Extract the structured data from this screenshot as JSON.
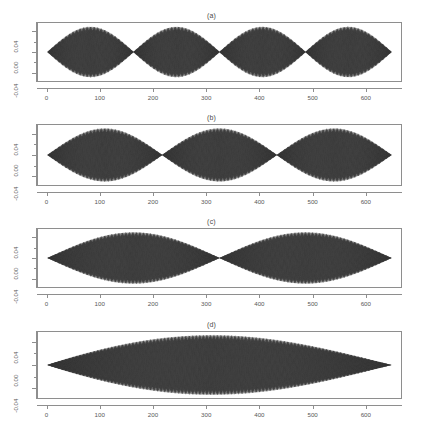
{
  "figure": {
    "caption_fragment": "",
    "background": "#ffffff",
    "trace_color": "#3a3a3a"
  },
  "axes": {
    "x_ticks": [
      0,
      100,
      200,
      300,
      400,
      500,
      600
    ],
    "x_tick_labels": [
      "0",
      "100",
      "200",
      "300",
      "400",
      "500",
      "600"
    ],
    "y_ticks": [
      -0.04,
      0.0,
      0.04
    ],
    "y_tick_labels": [
      "-0.04",
      "0.00",
      "0.04"
    ],
    "xlim": [
      -18,
      668
    ],
    "ylim": [
      -0.058,
      0.058
    ]
  },
  "chart_data": [
    {
      "type": "line",
      "title": "(a)",
      "xlabel": "",
      "ylabel": "",
      "xlim": [
        -18,
        668
      ],
      "ylim": [
        -0.058,
        0.058
      ],
      "xticks": [
        0,
        100,
        200,
        300,
        400,
        500,
        600
      ],
      "yticks": [
        -0.04,
        0.0,
        0.04
      ],
      "grid": false,
      "legend": "none",
      "description": "Dense oscillatory signal filling a 4-lobe sine envelope; nodes (zero amplitude) at x = 0, 163, 325, 488, 650.",
      "envelope": {
        "type": "abs-sine",
        "half_periods": 4,
        "amplitude": 0.051,
        "x_start": 0,
        "x_end": 650,
        "nodes": [
          0,
          163,
          325,
          488,
          650
        ],
        "antinodes": [
          81,
          244,
          406,
          569
        ]
      }
    },
    {
      "type": "line",
      "title": "(b)",
      "xlabel": "",
      "ylabel": "",
      "xlim": [
        -18,
        668
      ],
      "ylim": [
        -0.058,
        0.058
      ],
      "xticks": [
        0,
        100,
        200,
        300,
        400,
        500,
        600
      ],
      "yticks": [
        -0.04,
        0.0,
        0.04
      ],
      "grid": false,
      "legend": "none",
      "description": "Dense oscillatory signal filling a 3-lobe sine envelope; nodes at x = 0, 217, 433, 650.",
      "envelope": {
        "type": "abs-sine",
        "half_periods": 3,
        "amplitude": 0.052,
        "x_start": 0,
        "x_end": 650,
        "nodes": [
          0,
          217,
          433,
          650
        ],
        "antinodes": [
          108,
          325,
          542
        ]
      }
    },
    {
      "type": "line",
      "title": "(c)",
      "xlabel": "",
      "ylabel": "",
      "xlim": [
        -18,
        668
      ],
      "ylim": [
        -0.058,
        0.058
      ],
      "xticks": [
        0,
        100,
        200,
        300,
        400,
        500,
        600
      ],
      "yticks": [
        -0.04,
        0.0,
        0.04
      ],
      "grid": false,
      "legend": "none",
      "description": "Dense oscillatory signal filling a 2-lobe sine envelope; nodes at x = 0, 325, 650.",
      "envelope": {
        "type": "abs-sine",
        "half_periods": 2,
        "amplitude": 0.052,
        "x_start": 0,
        "x_end": 650,
        "nodes": [
          0,
          325,
          650
        ],
        "antinodes": [
          163,
          488
        ]
      }
    },
    {
      "type": "line",
      "title": "(d)",
      "xlabel": "",
      "ylabel": "",
      "xlim": [
        -18,
        668
      ],
      "ylim": [
        -0.058,
        0.058
      ],
      "xticks": [
        0,
        100,
        200,
        300,
        400,
        500,
        600
      ],
      "yticks": [
        -0.04,
        0.0,
        0.04
      ],
      "grid": false,
      "legend": "none",
      "description": "Dense oscillatory signal filling a single-lobe sine envelope, slightly skewed with peak near x = 310; nodes at x = 0 and 650.",
      "envelope": {
        "type": "abs-sine-skewed",
        "half_periods": 1,
        "amplitude": 0.053,
        "x_start": 0,
        "x_end": 650,
        "nodes": [
          0,
          650
        ],
        "antinodes": [
          310
        ]
      }
    }
  ],
  "panels": [
    {
      "name": "panel-a",
      "title": "(a)",
      "top": 10,
      "plot_top": 22,
      "plot_height": 60,
      "axis_top": 83
    },
    {
      "name": "panel-b",
      "title": "(b)",
      "top": 112,
      "plot_top": 124,
      "plot_height": 62,
      "axis_top": 187
    },
    {
      "name": "panel-c",
      "title": "(c)",
      "top": 216,
      "plot_top": 228,
      "plot_height": 60,
      "axis_top": 289
    },
    {
      "name": "panel-d",
      "title": "(d)",
      "top": 319,
      "plot_top": 331,
      "plot_height": 68,
      "axis_top": 400
    }
  ]
}
